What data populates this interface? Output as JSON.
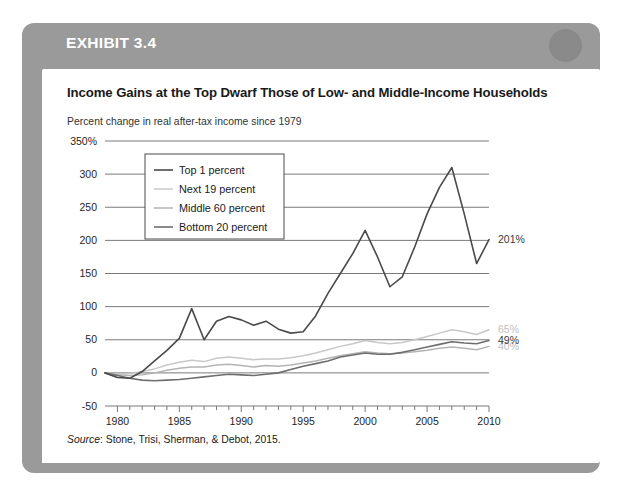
{
  "exhibit": {
    "label": "EXHIBIT 3.4",
    "header_color": "#9a9a9a",
    "circle_color": "#8a8a8a"
  },
  "chart_title": "Income Gains at the Top Dwarf Those of Low- and Middle-Income Households",
  "chart_subtitle": "Percent change in real after-tax income since 1979",
  "source": {
    "lead": "Source",
    "text": ": Stone, Trisi, Sherman, & Debot, 2015."
  },
  "chart_data": {
    "type": "line",
    "title": "Income Gains at the Top Dwarf Those of Low- and Middle-Income Households",
    "subtitle": "Percent change in real after-tax income since 1979",
    "xlabel": "",
    "ylabel": "",
    "xlim": [
      1979,
      2010
    ],
    "ylim": [
      -50,
      350
    ],
    "ytick_labels": [
      "350%",
      "300",
      "250",
      "200",
      "150",
      "100",
      "50",
      "0",
      "-50"
    ],
    "ytick_values": [
      350,
      300,
      250,
      200,
      150,
      100,
      50,
      0,
      -50
    ],
    "xtick_labels": [
      "1980",
      "1985",
      "1990",
      "1995",
      "2000",
      "2005",
      "2010"
    ],
    "xtick_values": [
      1980,
      1985,
      1990,
      1995,
      2000,
      2005,
      2010
    ],
    "minor_xticks": true,
    "grid": "horizontal",
    "legend_position": "upper-left",
    "x": [
      1979,
      1980,
      1981,
      1982,
      1983,
      1984,
      1985,
      1986,
      1987,
      1988,
      1989,
      1990,
      1991,
      1992,
      1993,
      1994,
      1995,
      1996,
      1997,
      1998,
      1999,
      2000,
      2001,
      2002,
      2003,
      2004,
      2005,
      2006,
      2007,
      2008,
      2009,
      2010
    ],
    "series": [
      {
        "name": "Top 1 percent",
        "color": "#4a4a4a",
        "width": 1.6,
        "end_label": "201%",
        "end_label_color": "#3a3a3a",
        "values": [
          0,
          -7,
          -8,
          2,
          18,
          34,
          52,
          97,
          50,
          78,
          85,
          80,
          72,
          78,
          66,
          60,
          62,
          86,
          120,
          150,
          180,
          215,
          175,
          130,
          145,
          190,
          240,
          280,
          310,
          240,
          165,
          201
        ]
      },
      {
        "name": "Next 19 percent",
        "color": "#c8c8c8",
        "width": 1.5,
        "end_label": "65%",
        "end_label_color": "#c0c0c0",
        "values": [
          0,
          -2,
          -1,
          2,
          6,
          12,
          16,
          19,
          17,
          22,
          24,
          22,
          20,
          21,
          21,
          23,
          26,
          30,
          35,
          40,
          44,
          49,
          46,
          44,
          46,
          50,
          55,
          60,
          65,
          62,
          58,
          65
        ]
      },
      {
        "name": "Middle 60 percent",
        "color": "#b4b4b4",
        "width": 1.5,
        "end_label": "40%",
        "end_label_color": "#bdbdbd",
        "values": [
          0,
          -3,
          -4,
          -3,
          0,
          4,
          7,
          9,
          9,
          12,
          13,
          11,
          9,
          11,
          10,
          12,
          15,
          18,
          22,
          26,
          29,
          32,
          30,
          29,
          30,
          32,
          34,
          37,
          39,
          37,
          35,
          40
        ]
      },
      {
        "name": "Bottom 20 percent",
        "color": "#6e6e6e",
        "width": 1.6,
        "end_label": "49%",
        "end_label_color": "#3a3a3a",
        "values": [
          0,
          -4,
          -8,
          -11,
          -12,
          -11,
          -10,
          -8,
          -6,
          -4,
          -2,
          -3,
          -4,
          -2,
          0,
          5,
          10,
          14,
          18,
          24,
          27,
          30,
          28,
          28,
          31,
          35,
          39,
          43,
          47,
          45,
          44,
          49
        ]
      }
    ]
  }
}
